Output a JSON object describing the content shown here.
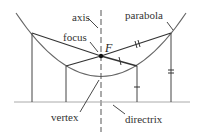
{
  "labels": {
    "axis": "axis",
    "focus": "focus",
    "F": "F",
    "parabola": "parabola",
    "vertex": "vertex",
    "directrix": "directrix"
  },
  "colors": {
    "line": "#333333",
    "curve": "#555555"
  }
}
